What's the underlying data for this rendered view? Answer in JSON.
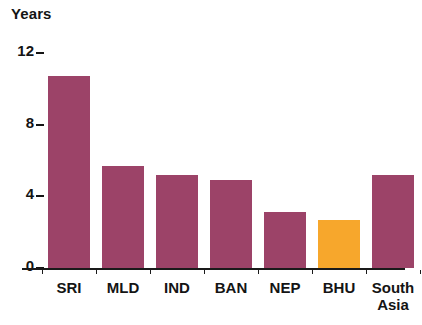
{
  "chart_data": {
    "type": "bar",
    "title": "",
    "subtitle": "",
    "xlabel": "",
    "ylabel": "Years",
    "categories": [
      "SRI",
      "MLD",
      "IND",
      "BAN",
      "NEP",
      "BHU",
      "South\nAsia"
    ],
    "values": [
      10.7,
      5.7,
      5.2,
      4.9,
      3.1,
      2.7,
      5.2
    ],
    "ylim": [
      0,
      12
    ],
    "yticks": [
      0,
      4,
      8,
      12
    ],
    "ytick_labels": [
      "0",
      "4",
      "8",
      "12"
    ],
    "grid": false,
    "legend": "none",
    "highlight_index": 5,
    "colors": {
      "bar_default": "#9C4368",
      "bar_highlight": "#F7A72C",
      "axis": "#1a1a1a",
      "text": "#141414",
      "background": "#ffffff"
    },
    "series": [
      {
        "name": "Years",
        "values": [
          10.7,
          5.7,
          5.2,
          4.9,
          3.1,
          2.7,
          5.2
        ]
      }
    ]
  }
}
